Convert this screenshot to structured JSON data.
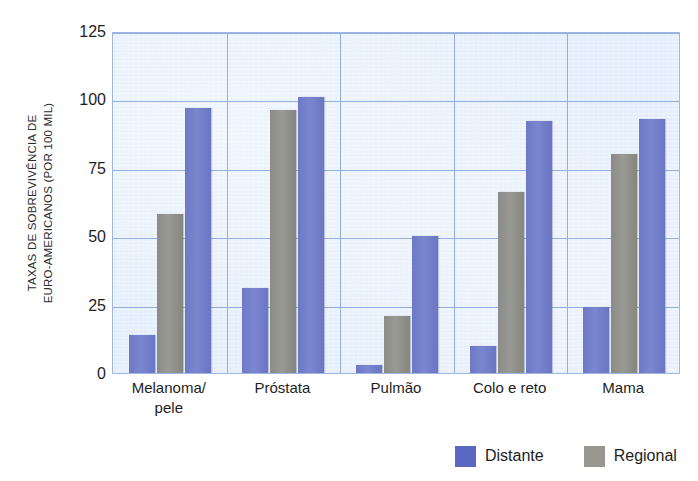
{
  "chart_data": {
    "type": "bar",
    "title": "",
    "xlabel": "",
    "ylabel": "TAXAS DE SOBREVIVÊNCIA DE EURO-AMERICANOS (POR 100 MIL)",
    "ylabel_line1": "TAXAS DE SOBREVIVÊNCIA DE",
    "ylabel_line2": "EURO-AMERICANOS (POR 100 MIL)",
    "ylim": [
      0,
      125
    ],
    "yticks": [
      0,
      25,
      50,
      75,
      100,
      125
    ],
    "ytick_labels": [
      "0",
      "25",
      "50",
      "75",
      "100",
      "125"
    ],
    "grid": "horizontal-and-vertical",
    "legend_position": "bottom-right",
    "categories": [
      "Melanoma/ pele",
      "Próstata",
      "Pulmão",
      "Colo e reto",
      "Mama"
    ],
    "category_lines": [
      [
        "Melanoma/",
        "pele"
      ],
      [
        "Próstata"
      ],
      [
        "Pulmão"
      ],
      [
        "Colo e reto"
      ],
      [
        "Mama"
      ]
    ],
    "series": [
      {
        "name": "Distante",
        "color": "#6d79c6",
        "values": [
          14,
          31,
          3,
          10,
          24
        ]
      },
      {
        "name": "Regional",
        "color": "#8e8e8a",
        "values": [
          58,
          96,
          21,
          66,
          80
        ]
      },
      {
        "name": "Distante",
        "color": "#6d79c6",
        "values": [
          97,
          101,
          50,
          92,
          93
        ]
      }
    ],
    "bar_order_per_group": [
      "Distante",
      "Regional",
      "Distante"
    ],
    "colors": {
      "distante": "#6d79c6",
      "regional": "#8e8e8a",
      "plot_background": "#e4eefc",
      "gridline": "#94aee0",
      "text": "#1e1e1e"
    }
  },
  "legend": {
    "items": [
      {
        "label": "Distante",
        "swatch": "distante"
      },
      {
        "label": "Regional",
        "swatch": "regional"
      }
    ]
  }
}
